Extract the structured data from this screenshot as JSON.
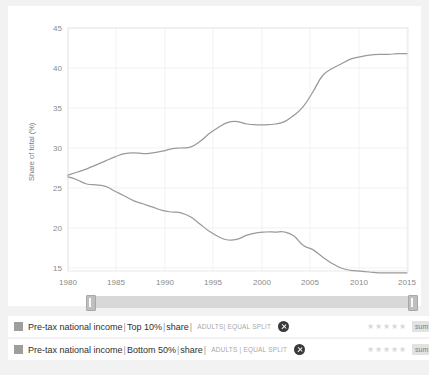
{
  "chart_data": {
    "type": "line",
    "title": "",
    "xlabel": "",
    "ylabel": "Share of total (%)",
    "xlim": [
      1980,
      2016
    ],
    "ylim": [
      13,
      45
    ],
    "grid": true,
    "legend_position": "bottom",
    "x_ticks": [
      "1980",
      "1985",
      "1990",
      "1995",
      "2000",
      "2005",
      "2010",
      "2015"
    ],
    "y_ticks": [
      "15",
      "20",
      "25",
      "30",
      "35",
      "40",
      "45"
    ],
    "x": [
      1980,
      1981,
      1982,
      1983,
      1984,
      1985,
      1986,
      1987,
      1988,
      1989,
      1990,
      1991,
      1992,
      1993,
      1994,
      1995,
      1996,
      1997,
      1998,
      1999,
      2000,
      2001,
      2002,
      2003,
      2004,
      2005,
      2006,
      2007,
      2008,
      2009,
      2010,
      2011,
      2012,
      2013,
      2014,
      2015,
      2016
    ],
    "series": [
      {
        "name": "Pre-tax national income | Top 10% | share",
        "color": "#9a9a9a",
        "values": [
          26.6,
          27.0,
          27.4,
          27.9,
          28.4,
          28.9,
          29.3,
          29.4,
          29.3,
          29.4,
          29.6,
          29.9,
          30.0,
          30.1,
          30.8,
          31.8,
          32.6,
          33.2,
          33.3,
          33.0,
          32.9,
          32.9,
          33.0,
          33.3,
          34.1,
          35.2,
          37.0,
          39.0,
          39.9,
          40.5,
          41.1,
          41.4,
          41.6,
          41.7,
          41.7,
          41.8,
          41.8
        ]
      },
      {
        "name": "Pre-tax national income | Bottom 50% | share",
        "color": "#9a9a9a",
        "values": [
          26.4,
          26.0,
          25.5,
          25.4,
          25.2,
          24.6,
          24.0,
          23.4,
          23.0,
          22.6,
          22.2,
          22.0,
          21.9,
          21.4,
          20.5,
          19.6,
          18.9,
          18.5,
          18.6,
          19.1,
          19.4,
          19.5,
          19.5,
          19.5,
          19.0,
          17.8,
          17.3,
          16.4,
          15.6,
          15.0,
          14.7,
          14.6,
          14.5,
          14.4,
          14.4,
          14.4,
          14.4
        ]
      }
    ],
    "series_extra": {
      "top10_late": [
        42.3,
        41.2,
        41.6,
        41.4,
        41.0,
        41.0
      ],
      "bottom50_late": [
        14.2,
        14.4,
        14.8,
        14.4,
        14.5,
        14.5
      ]
    }
  },
  "slider": {
    "name": "year-range-slider",
    "start_label": "1980",
    "end_label": "2016"
  },
  "legend": {
    "rows": [
      {
        "indicator": "Pre-tax national income",
        "percentile": "Top 10%",
        "measure": "share",
        "meta": "ADULTS| EQUAL SPLIT",
        "stars": "★★★★★",
        "source_label": "sum"
      },
      {
        "indicator": "Pre-tax national income",
        "percentile": "Bottom 50%",
        "measure": "share",
        "meta": "ADULTS | EQUAL SPLIT",
        "stars": "★★★★★",
        "source_label": "sum"
      }
    ],
    "separator": "|"
  },
  "colors": {
    "line": "#9a9a9a",
    "grid": "#ededf2",
    "page_bg": "#f2f2f2",
    "card_bg": "#ffffff",
    "swatch": "#9e9e9e"
  }
}
